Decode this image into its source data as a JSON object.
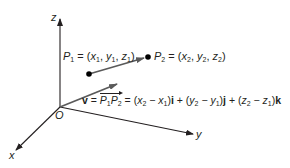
{
  "diagram": {
    "type": "3d-vector",
    "axes": {
      "x_label": "x",
      "y_label": "y",
      "z_label": "z",
      "origin_label": "O"
    },
    "points": {
      "p1": {
        "name": "P",
        "sub": "1",
        "eq": "=",
        "coords": [
          "x",
          "1",
          "y",
          "1",
          "z",
          "1"
        ]
      },
      "p2": {
        "name": "P",
        "sub": "2",
        "eq": "=",
        "coords": [
          "x",
          "2",
          "y",
          "2",
          "z",
          "2"
        ]
      }
    },
    "equation": {
      "vector": "v",
      "equals": "=",
      "p1": "P",
      "p1_sub": "1",
      "p2": "P",
      "p2_sub": "2",
      "terms": [
        {
          "a": "x",
          "a_sub": "2",
          "b": "x",
          "b_sub": "1",
          "unit": "i"
        },
        {
          "a": "y",
          "a_sub": "2",
          "b": "y",
          "b_sub": "1",
          "unit": "j"
        },
        {
          "a": "z",
          "a_sub": "2",
          "b": "z",
          "b_sub": "1",
          "unit": "k"
        }
      ]
    },
    "colors": {
      "axis": "#231f20",
      "arrow": "#5a5a5a",
      "dot": "#000000",
      "text": "#231f20"
    }
  }
}
